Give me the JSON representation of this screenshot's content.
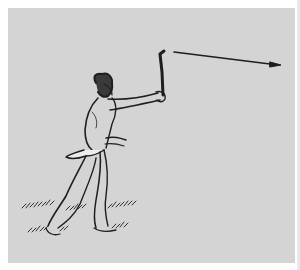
{
  "illustration": {
    "subject": "man throwing boomerang",
    "colors": {
      "background": "#ffffff",
      "panel": "#d4d4d4",
      "ink": "#1e1e1e"
    },
    "elements": [
      "figure",
      "boomerang",
      "trajectory-arrow",
      "grass"
    ]
  }
}
